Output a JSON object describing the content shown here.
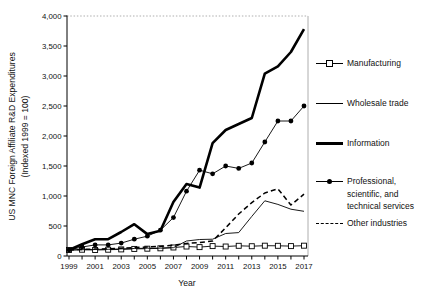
{
  "chart_data": {
    "type": "line",
    "title": "",
    "xlabel": "Year",
    "ylabel_line1": "US MNC Foreign Affiliate R&D Expenditures",
    "ylabel_line2": "(Indexed 1999 = 100)",
    "x": [
      1999,
      2000,
      2001,
      2002,
      2003,
      2004,
      2005,
      2006,
      2007,
      2008,
      2009,
      2010,
      2011,
      2012,
      2013,
      2014,
      2015,
      2016,
      2017
    ],
    "x_tick_labels": [
      "1999",
      "2001",
      "2003",
      "2005",
      "2007",
      "2009",
      "2011",
      "2013",
      "2015",
      "2017"
    ],
    "y_ticks": [
      0,
      500,
      1000,
      1500,
      2000,
      2500,
      3000,
      3500,
      4000
    ],
    "y_tick_labels": [
      "0",
      "500",
      "1,000",
      "1,500",
      "2,000",
      "2,500",
      "3,000",
      "3,500",
      "4,000"
    ],
    "ylim": [
      0,
      4000
    ],
    "grid": false,
    "legend_position": "right",
    "color": "#000000",
    "series": [
      {
        "name": "Manufacturing",
        "style": "thin",
        "marker": "open-square",
        "dash": "solid",
        "values": [
          100,
          105,
          100,
          105,
          110,
          118,
          122,
          128,
          142,
          158,
          148,
          165,
          158,
          170,
          163,
          172,
          170,
          165,
          172
        ]
      },
      {
        "name": "Wholesale trade",
        "style": "thin",
        "marker": "none",
        "dash": "solid",
        "values": [
          100,
          105,
          110,
          112,
          118,
          125,
          130,
          130,
          138,
          250,
          275,
          280,
          375,
          390,
          660,
          920,
          860,
          780,
          745
        ]
      },
      {
        "name": "Information",
        "style": "thick",
        "marker": "none",
        "dash": "solid",
        "values": [
          100,
          195,
          280,
          280,
          400,
          530,
          365,
          420,
          900,
          1200,
          1140,
          1880,
          2100,
          2200,
          2300,
          3040,
          3160,
          3400,
          3780
        ]
      },
      {
        "name": "Professional, scientific, and technical services",
        "style": "thin",
        "marker": "filled-circle",
        "dash": "solid",
        "values": [
          100,
          150,
          185,
          185,
          215,
          280,
          330,
          430,
          640,
          1080,
          1430,
          1370,
          1500,
          1460,
          1550,
          1900,
          2250,
          2250,
          2500
        ]
      },
      {
        "name": "Other industries",
        "style": "medium",
        "marker": "none",
        "dash": "dashed",
        "values": [
          100,
          110,
          115,
          120,
          130,
          140,
          150,
          160,
          180,
          210,
          225,
          250,
          470,
          700,
          890,
          1050,
          1120,
          850,
          1030
        ]
      }
    ]
  }
}
